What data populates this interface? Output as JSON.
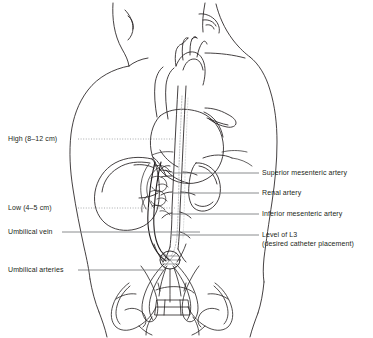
{
  "figure": {
    "kind": "medical-illustration",
    "background_color": "#ffffff",
    "line_color": "#231f20",
    "text_color": "#231f20",
    "leader_color": "#6d6e71"
  },
  "labels_left": [
    {
      "id": "high",
      "text": "High (8–12 cm)",
      "x": 8,
      "y": 136,
      "leader": "dotted",
      "leader_to_x": 120
    },
    {
      "id": "low",
      "text": "Low (4–5 cm)",
      "x": 8,
      "y": 205,
      "leader": "dotted",
      "leader_to_x": 120
    },
    {
      "id": "umbilical-vein",
      "text": "Umbilical vein",
      "x": 8,
      "y": 229,
      "leader": "solid",
      "leader_to_x": 162
    },
    {
      "id": "umbilical-arteries",
      "text": "Umbilical arteries",
      "x": 8,
      "y": 267,
      "leader": "solid",
      "leader_to_x": 150
    }
  ],
  "labels_right": [
    {
      "id": "superior-mesenteric-artery",
      "text": "Superior mesenteric artery",
      "x": 262,
      "y": 170,
      "leader_from_x": 172,
      "leader_y": 172
    },
    {
      "id": "renal-artery",
      "text": "Renal artery",
      "x": 262,
      "y": 190,
      "leader_from_x": 172,
      "leader_y": 192
    },
    {
      "id": "inferior-mesenteric-artery",
      "text": "Inferior mesenteric artery",
      "x": 262,
      "y": 211,
      "leader_from_x": 172,
      "leader_y": 213
    },
    {
      "id": "level-of-l3-line1",
      "text": "Level of L3",
      "x": 262,
      "y": 232,
      "leader_from_x": 172,
      "leader_y": 234
    },
    {
      "id": "level-of-l3-line2",
      "text": "(desired catheter placement)",
      "x": 262,
      "y": 241,
      "leader_from_x": null,
      "leader_y": null
    }
  ],
  "anatomy": [
    {
      "id": "torso-outline",
      "name": "Infant torso and pelvis outline"
    },
    {
      "id": "neck-and-ears",
      "name": "Neck, chin and ear contours"
    },
    {
      "id": "heart",
      "name": "Heart with great vessels"
    },
    {
      "id": "aortic-arch",
      "name": "Aortic arch"
    },
    {
      "id": "descending-aorta",
      "name": "Descending aorta"
    },
    {
      "id": "liver",
      "name": "Liver"
    },
    {
      "id": "kidneys",
      "name": "Kidneys"
    },
    {
      "id": "mesenteric-vessels",
      "name": "Mesenteric arterial branches"
    },
    {
      "id": "umbilical-vein-vessel",
      "name": "Umbilical vein"
    },
    {
      "id": "umbilical-artery-vessels",
      "name": "Umbilical arteries"
    },
    {
      "id": "umbilicus",
      "name": "Umbilicus / insertion site"
    },
    {
      "id": "catheter-track",
      "name": "Catheter track (dotted)"
    },
    {
      "id": "pelvic-bones",
      "name": "Pelvic bones and sacrum"
    }
  ]
}
